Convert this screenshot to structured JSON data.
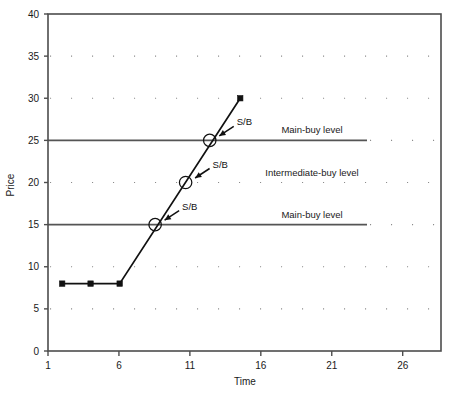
{
  "chart_data": {
    "type": "line",
    "title": "",
    "xlabel": "Time",
    "ylabel": "Price",
    "xlim": [
      1,
      28.7
    ],
    "ylim": [
      0,
      40
    ],
    "grid": true,
    "legend_position": "none",
    "x_ticks": [
      1,
      6,
      11,
      16,
      21,
      26
    ],
    "y_ticks": [
      0,
      5,
      10,
      15,
      20,
      25,
      30,
      35,
      40
    ],
    "x_tick_labels": [
      "1",
      "6",
      "11",
      "16",
      "21",
      "26"
    ],
    "y_tick_labels": [
      "0",
      "5",
      "10",
      "15",
      "20",
      "25",
      "30",
      "35",
      "40"
    ],
    "solid_gridline_values": [
      15,
      25
    ],
    "dotted_gridline_values": [
      5,
      10,
      20,
      30,
      35
    ],
    "series": [
      {
        "name": "price",
        "marker": "square",
        "x": [
          2.0,
          4.0,
          6.05,
          14.55
        ],
        "y": [
          8,
          8,
          8,
          30
        ]
      }
    ],
    "annotations": [
      {
        "label": "S/B",
        "x": 8.55,
        "y": 15,
        "marker": "circle"
      },
      {
        "label": "S/B",
        "x": 10.7,
        "y": 20,
        "marker": "circle"
      },
      {
        "label": "S/B",
        "x": 12.4,
        "y": 25,
        "marker": "circle"
      }
    ],
    "level_labels": [
      {
        "text": "Main-buy level",
        "y": 25
      },
      {
        "text": "Intermediate-buy level",
        "y": 20
      },
      {
        "text": "Main-buy level",
        "y": 15
      }
    ],
    "colors": {
      "axis": "#4d4d4d",
      "series_line": "#111111",
      "marker": "#111111",
      "solid_level_line": "#555555",
      "dotted_gridline": "#8c8c8c",
      "text": "#1a1a1a",
      "background": "#ffffff"
    }
  }
}
